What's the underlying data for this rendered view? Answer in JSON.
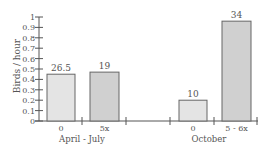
{
  "chart_data": {
    "type": "bar",
    "title": "",
    "xlabel": "",
    "ylabel": "Birds / hour",
    "ylim": [
      0,
      1
    ],
    "yticks": [
      "0",
      "0.1",
      "0.2",
      "0.3",
      "0.4",
      "0.5",
      "0.6",
      "0.7",
      "0.8",
      "0.9",
      "1"
    ],
    "grid": false,
    "legend": null,
    "groups": [
      {
        "label": "April - July",
        "bars": [
          {
            "category": "0",
            "value": 0.45,
            "annotation": "26.5",
            "color": "#e4e4e4"
          },
          {
            "category": "5x",
            "value": 0.47,
            "annotation": "19",
            "color": "#d0d0d0"
          }
        ]
      },
      {
        "label": "October",
        "bars": [
          {
            "category": "0",
            "value": 0.2,
            "annotation": "10",
            "color": "#e4e4e4"
          },
          {
            "category": "5 - 6x",
            "value": 0.96,
            "annotation": "34",
            "color": "#d0d0d0"
          }
        ]
      }
    ],
    "categories": [
      "0",
      "5x",
      "0",
      "5 - 6x"
    ],
    "values": [
      0.45,
      0.47,
      0.2,
      0.96
    ]
  },
  "colors": {
    "axis": "#555555",
    "bar_border": "#666666",
    "bar_light": "#e4e4e4",
    "bar_dark": "#d0d0d0"
  }
}
